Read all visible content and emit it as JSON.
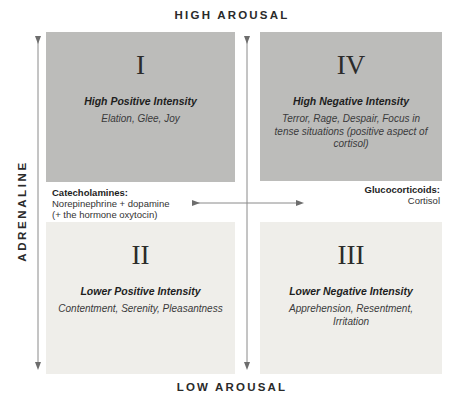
{
  "axes": {
    "top": "HIGH AROUSAL",
    "bottom": "LOW AROUSAL",
    "left": "ADRENALINE"
  },
  "quadrants": [
    {
      "id": "I",
      "title": "High Positive Intensity",
      "desc": "Elation, Glee, Joy",
      "shade": "dark"
    },
    {
      "id": "IV",
      "title": "High Negative Intensity",
      "desc": "Terror, Rage, Despair, Focus in tense situations (positive aspect of cortisol)",
      "shade": "dark"
    },
    {
      "id": "II",
      "title": "Lower Positive Intensity",
      "desc": "Contentment, Serenity, Pleasantness",
      "shade": "light"
    },
    {
      "id": "III",
      "title": "Lower Negative Intensity",
      "desc": "Apprehension, Resentment, Irritation",
      "shade": "light"
    }
  ],
  "notes": {
    "left": {
      "heading": "Catecholamines:",
      "line1": "Norepinephrine + dopamine",
      "line2": "(+ the hormone oxytocin)"
    },
    "right": {
      "heading": "Glucocorticoids:",
      "line1": "Cortisol"
    }
  },
  "colors": {
    "dark_box": "#bcbcba",
    "light_box": "#efeeea",
    "arrow": "#777777"
  }
}
